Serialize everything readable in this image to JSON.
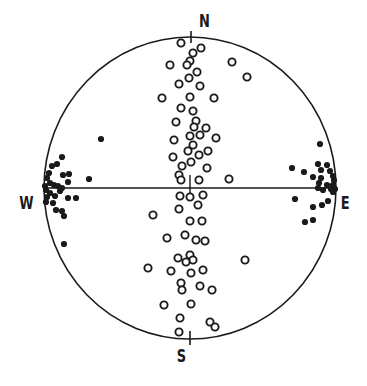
{
  "diagram": {
    "type": "stereonet",
    "colors": {
      "ink": "#1a1a1a",
      "background": "#ffffff"
    },
    "primitive_circle": {
      "cx": 190,
      "cy": 188,
      "rx": 146,
      "ry": 151
    },
    "labels": {
      "north": "N",
      "south": "S",
      "west": "W",
      "east": "E"
    },
    "open_circles": [
      [
        181,
        43
      ],
      [
        201,
        48
      ],
      [
        193,
        53
      ],
      [
        190,
        61
      ],
      [
        170,
        65
      ],
      [
        187,
        65
      ],
      [
        232,
        62
      ],
      [
        197,
        72
      ],
      [
        189,
        78
      ],
      [
        247,
        77
      ],
      [
        179,
        84
      ],
      [
        200,
        86
      ],
      [
        162,
        98
      ],
      [
        190,
        97
      ],
      [
        214,
        98
      ],
      [
        181,
        108
      ],
      [
        193,
        111
      ],
      [
        176,
        122
      ],
      [
        196,
        121
      ],
      [
        194,
        127
      ],
      [
        206,
        128
      ],
      [
        190,
        136
      ],
      [
        200,
        135
      ],
      [
        216,
        138
      ],
      [
        174,
        140
      ],
      [
        193,
        145
      ],
      [
        188,
        151
      ],
      [
        208,
        151
      ],
      [
        199,
        155
      ],
      [
        173,
        157
      ],
      [
        182,
        166
      ],
      [
        191,
        162
      ],
      [
        207,
        168
      ],
      [
        179,
        175
      ],
      [
        229,
        179
      ],
      [
        181,
        180
      ],
      [
        199,
        180
      ],
      [
        180,
        196
      ],
      [
        190,
        197
      ],
      [
        203,
        195
      ],
      [
        153,
        215
      ],
      [
        179,
        209
      ],
      [
        198,
        205
      ],
      [
        190,
        221
      ],
      [
        202,
        221
      ],
      [
        167,
        238
      ],
      [
        185,
        235
      ],
      [
        196,
        240
      ],
      [
        205,
        241
      ],
      [
        178,
        258
      ],
      [
        190,
        255
      ],
      [
        193,
        260
      ],
      [
        186,
        262
      ],
      [
        245,
        260
      ],
      [
        148,
        268
      ],
      [
        171,
        271
      ],
      [
        191,
        273
      ],
      [
        203,
        270
      ],
      [
        181,
        283
      ],
      [
        182,
        290
      ],
      [
        200,
        286
      ],
      [
        212,
        290
      ],
      [
        164,
        305
      ],
      [
        191,
        304
      ],
      [
        180,
        318
      ],
      [
        210,
        322
      ],
      [
        215,
        327
      ],
      [
        179,
        332
      ]
    ],
    "filled_dots": [
      [
        101,
        139
      ],
      [
        62,
        157
      ],
      [
        57,
        164
      ],
      [
        52,
        166
      ],
      [
        49,
        173
      ],
      [
        47,
        178
      ],
      [
        63,
        175
      ],
      [
        69,
        174
      ],
      [
        68,
        182
      ],
      [
        89,
        179
      ],
      [
        45,
        186
      ],
      [
        50,
        183
      ],
      [
        54,
        185
      ],
      [
        58,
        186
      ],
      [
        62,
        188
      ],
      [
        46,
        190
      ],
      [
        50,
        193
      ],
      [
        55,
        196
      ],
      [
        60,
        191
      ],
      [
        47,
        197
      ],
      [
        46,
        202
      ],
      [
        53,
        203
      ],
      [
        68,
        198
      ],
      [
        76,
        198
      ],
      [
        56,
        210
      ],
      [
        62,
        211
      ],
      [
        64,
        216
      ],
      [
        64,
        244
      ],
      [
        320,
        144
      ],
      [
        292,
        168
      ],
      [
        304,
        172
      ],
      [
        318,
        164
      ],
      [
        327,
        165
      ],
      [
        321,
        170
      ],
      [
        330,
        171
      ],
      [
        313,
        177
      ],
      [
        321,
        178
      ],
      [
        333,
        176
      ],
      [
        319,
        183
      ],
      [
        327,
        185
      ],
      [
        333,
        185
      ],
      [
        334,
        180
      ],
      [
        335,
        189
      ],
      [
        331,
        189
      ],
      [
        323,
        190
      ],
      [
        333,
        192
      ],
      [
        318,
        188
      ],
      [
        295,
        199
      ],
      [
        328,
        201
      ],
      [
        322,
        205
      ],
      [
        313,
        207
      ],
      [
        313,
        220
      ],
      [
        305,
        222
      ]
    ]
  }
}
